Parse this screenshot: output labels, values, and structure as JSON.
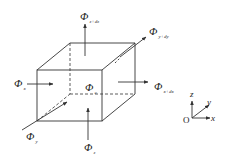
{
  "diagram": {
    "type": "control-volume-flux-diagram",
    "center_label": {
      "symbol": "Φ",
      "subscript": "c"
    },
    "fluxes": [
      {
        "id": "x-in",
        "symbol": "Φ",
        "subscript": "x",
        "direction": "+x",
        "face": "left"
      },
      {
        "id": "x-out",
        "symbol": "Φ",
        "subscript": "x+dx",
        "direction": "+x",
        "face": "right"
      },
      {
        "id": "y-in",
        "symbol": "Φ",
        "subscript": "y",
        "direction": "+y",
        "face": "front"
      },
      {
        "id": "y-out",
        "symbol": "Φ",
        "subscript": "y+dy",
        "direction": "+y",
        "face": "back"
      },
      {
        "id": "z-in",
        "symbol": "Φ",
        "subscript": "z",
        "direction": "+z",
        "face": "bottom"
      },
      {
        "id": "z-out",
        "symbol": "Φ",
        "subscript": "z+dz",
        "direction": "+z",
        "face": "top"
      }
    ],
    "axes": {
      "origin": "O",
      "x": "x",
      "y": "y",
      "z": "z"
    },
    "colors": {
      "line": "#333333",
      "background": "#ffffff"
    }
  }
}
